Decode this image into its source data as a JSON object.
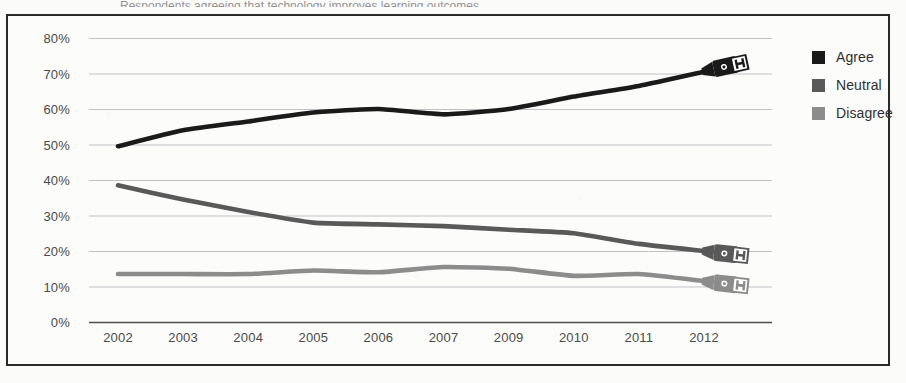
{
  "frame": {
    "border_color": "#2b2b2b",
    "background": "#fcfcfb"
  },
  "top_remnant_text": "Respondents agreeing that technology improves learning outcomes",
  "legend": {
    "position": "right",
    "items": [
      {
        "label": "Agree",
        "color": "#1a1a1a",
        "swatch_name": "legend-swatch-agree"
      },
      {
        "label": "Neutral",
        "color": "#595959",
        "swatch_name": "legend-swatch-neutral"
      },
      {
        "label": "Disagree",
        "color": "#8c8c8c",
        "swatch_name": "legend-swatch-disagree"
      }
    ]
  },
  "endpoint_marker": {
    "name": "usb-connector-icon",
    "description": "USB plug style connector drawn at the right end of each line"
  },
  "chart_data": {
    "type": "line",
    "title": "",
    "subtitle": "",
    "xlabel": "",
    "ylabel": "",
    "categories": [
      "2002",
      "2003",
      "2004",
      "2005",
      "2006",
      "2007",
      "2009",
      "2010",
      "2011",
      "2012"
    ],
    "ylim": [
      0,
      80
    ],
    "ytick_labels": [
      "0%",
      "10%",
      "20%",
      "30%",
      "40%",
      "50%",
      "60%",
      "70%",
      "80%"
    ],
    "ytick_values": [
      0,
      10,
      20,
      30,
      40,
      50,
      60,
      70,
      80
    ],
    "grid": true,
    "grid_axis": "y",
    "legend_position": "right",
    "series": [
      {
        "name": "Agree",
        "color": "#1a1a1a",
        "values": [
          49.5,
          54,
          56.5,
          59,
          60,
          58.5,
          60,
          63.5,
          66.5,
          70.5
        ]
      },
      {
        "name": "Neutral",
        "color": "#595959",
        "values": [
          38.5,
          34.5,
          31,
          28,
          27.5,
          27,
          26,
          25,
          22,
          20
        ]
      },
      {
        "name": "Disagree",
        "color": "#8c8c8c",
        "values": [
          13.5,
          13.5,
          13.5,
          14.5,
          14,
          15.5,
          15,
          13,
          13.5,
          11.5
        ]
      }
    ]
  }
}
